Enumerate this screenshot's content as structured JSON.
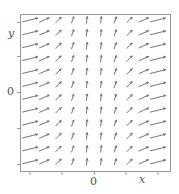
{
  "chart_data": {
    "type": "slope_field",
    "title": "",
    "xlabel": "x",
    "ylabel": "y",
    "x_tick_labels": [
      "0"
    ],
    "y_tick_labels": [
      "0"
    ],
    "grid": false,
    "legend": null,
    "columns": 10,
    "rows": 12,
    "column_angles_deg": [
      14,
      24,
      45,
      72,
      84,
      84,
      72,
      45,
      24,
      14
    ],
    "column_lengths_px": [
      16,
      11,
      8,
      7,
      7,
      7,
      7,
      8,
      11,
      16
    ],
    "note": "Direction field; slope positive everywhere, steepest near center columns, flattest at left and right edges, independent of y."
  },
  "axes": {
    "x_label": "x",
    "y_label": "y",
    "x_zero": "0",
    "y_zero": "0"
  },
  "colors": {
    "frame": "#9a9a9a",
    "arrow": "#666666",
    "text": "#555555"
  }
}
